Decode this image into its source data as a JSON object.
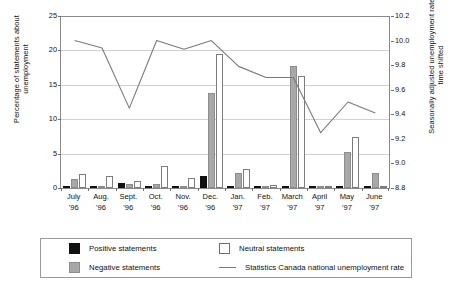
{
  "chart_data": {
    "type": "bar",
    "title": "",
    "xlabel": "",
    "ylabel": "Percentage of statements about unemployment",
    "ylabel_right": "Seasonally adjusted unemployment rate, time shifted",
    "categories": [
      "July\n'96",
      "Aug.\n'96",
      "Sept.\n'96",
      "Oct.\n'96",
      "Nov.\n'96",
      "Dec.\n'96",
      "Jan.\n'97",
      "Feb.\n'97",
      "March\n'97",
      "April\n'97",
      "May\n'97",
      "June\n'97"
    ],
    "ylim": [
      0,
      25
    ],
    "yticks": [
      0,
      5,
      10,
      15,
      20,
      25
    ],
    "ylim_right": [
      8.8,
      10.2
    ],
    "yticks_right": [
      "8.8",
      "9.0",
      "9.2",
      "9.4",
      "9.6",
      "9.8",
      "10.0",
      "10.2"
    ],
    "grid": true,
    "legend_position": "bottom",
    "series": [
      {
        "name": "Positive statements",
        "color": "#111111",
        "type": "bar",
        "values": [
          0.0,
          0.0,
          0.7,
          0.0,
          0.0,
          1.7,
          0.2,
          0.0,
          0.0,
          0.0,
          0.2,
          0.0
        ]
      },
      {
        "name": "Negative statements",
        "color": "#a8a8a8",
        "type": "bar",
        "values": [
          1.3,
          0.2,
          0.6,
          0.6,
          0.3,
          13.8,
          2.2,
          0.0,
          17.7,
          0.0,
          5.3,
          2.2
        ]
      },
      {
        "name": "Neutral statements",
        "color": "#ffffff",
        "type": "bar",
        "values": [
          2.1,
          1.8,
          1.0,
          3.2,
          1.4,
          19.5,
          2.7,
          0.5,
          16.3,
          0.0,
          7.4,
          0.3
        ]
      },
      {
        "name": "Statistics Canada national unemployment rate",
        "color": "#7a7a7a",
        "type": "line",
        "axis": "right",
        "values": [
          10.0,
          9.94,
          9.45,
          10.0,
          9.93,
          10.0,
          9.79,
          9.7,
          9.7,
          9.25,
          9.5,
          9.41
        ]
      }
    ]
  },
  "axes": {
    "left_title": "Percentage of statements about\nunemployment",
    "right_title": "Seasonally adjusted unemployment rate,\ntime shifted",
    "left_ticks": [
      "0",
      "5",
      "10",
      "15",
      "20",
      "25"
    ],
    "right_ticks": [
      "8.8",
      "9.0",
      "9.2",
      "9.4",
      "9.6",
      "9.8",
      "10.0",
      "10.2"
    ]
  },
  "legend": {
    "positive_label": "Positive statements",
    "negative_label": "Negative statements",
    "neutral_label": "Neutral statements",
    "line_label": "Statistics Canada national unemployment rate"
  }
}
